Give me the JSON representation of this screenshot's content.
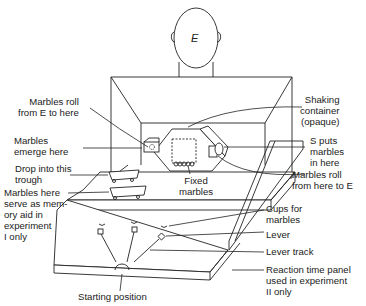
{
  "figure": {
    "experimenter_label": "E",
    "labels": {
      "marbles_roll_from_E": "Marbles roll\nfrom E to here",
      "marbles_emerge": "Marbles\nemerge here",
      "drop_into_trough": "Drop into this\ntrough",
      "memory_aid": "Marbles here\nserve as mem-\nory aid in\nexperiment\nI only",
      "shaking_container": "Shaking\ncontainer\n(opaque)",
      "s_puts_marbles": "S puts\nmarbles\nin here",
      "marbles_roll_to_E": "Marbles roll\nfrom here to E",
      "fixed_marbles": "Fixed\nmarbles",
      "cups_for_marbles": "Cups for\nmarbles",
      "lever": "Lever",
      "lever_track": "Lever track",
      "reaction_time_panel": "Reaction time panel\nused in experiment\nII only",
      "starting_position": "Starting position"
    }
  }
}
